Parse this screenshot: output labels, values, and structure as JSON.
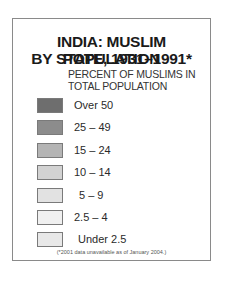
{
  "chart_data": {
    "type": "table",
    "kind": "choropleth-legend",
    "title": "INDIA: MUSLIM POPULATION BY STATE, 1931–1991*",
    "title_lines": [
      "INDIA: MUSLIM POPULATION",
      "BY STATE, 1931–1991*"
    ],
    "subtitle_lines": [
      "PERCENT OF MUSLIMS IN",
      "TOTAL POPULATION"
    ],
    "legend": [
      {
        "label": "Over 50",
        "color": "#6e6e6e",
        "label_x": 37
      },
      {
        "label": "25 – 49",
        "color": "#8c8c8c",
        "label_x": 37
      },
      {
        "label": "15 – 24",
        "color": "#b4b4b4",
        "label_x": 37
      },
      {
        "label": "10 – 14",
        "color": "#d2d2d2",
        "label_x": 37
      },
      {
        "label": "5 – 9",
        "color": "#e2e2e2",
        "label_x": 42
      },
      {
        "label": "2.5 – 4",
        "color": "#f0f0f0",
        "label_x": 37
      },
      {
        "label": "Under 2.5",
        "color": "#e8e8e8",
        "label_x": 41
      }
    ],
    "footnote": "(*2001 data unavailable as of January 2004.)"
  }
}
